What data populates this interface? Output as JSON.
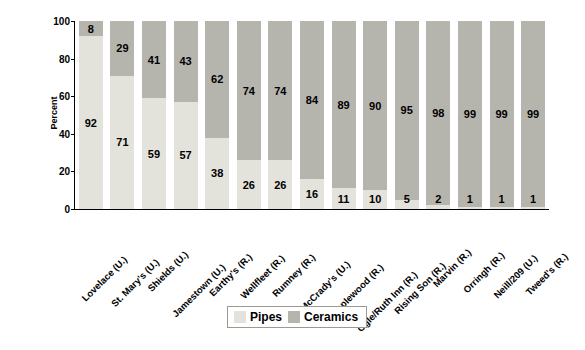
{
  "chart_data": {
    "type": "bar",
    "subtype": "stacked-percent",
    "title": "",
    "xlabel": "",
    "ylabel": "Percent",
    "ylim": [
      0,
      100
    ],
    "yticks": [
      0,
      20,
      40,
      60,
      80,
      100
    ],
    "grid": false,
    "legend_position": "bottom",
    "categories": [
      "Lovelace (U.)",
      "St. Mary's (U.)",
      "Shields (U.)",
      "Jamestown (U.)",
      "Earthy's (R.)",
      "Wellfleet (R.)",
      "Rumney (R.)",
      "McCrady's (U.)",
      "Maplewood (R.)",
      "Ogle/Ruth Inn (R.)",
      "Rising Son (R.)",
      "Marvin (R.)",
      "Orringh (R.)",
      "Neill/209 (U.)",
      "Tweed's (R.)"
    ],
    "series": [
      {
        "name": "Pipes",
        "color": "#e3e3db",
        "values": [
          92,
          71,
          59,
          57,
          38,
          26,
          26,
          16,
          11,
          10,
          5,
          2,
          1,
          1,
          1
        ]
      },
      {
        "name": "Ceramics",
        "color": "#b5b5ae",
        "values": [
          8,
          29,
          41,
          43,
          62,
          74,
          74,
          84,
          89,
          90,
          95,
          98,
          99,
          99,
          99
        ]
      }
    ]
  },
  "legend": {
    "items": [
      {
        "label": "Pipes"
      },
      {
        "label": "Ceramics"
      }
    ]
  }
}
